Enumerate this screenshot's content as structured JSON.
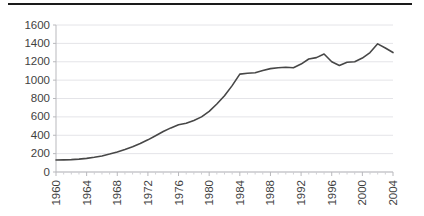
{
  "figure": {
    "top_rule_color": "#1a1a1a",
    "background_color": "#ffffff"
  },
  "chart_data": {
    "type": "line",
    "title": "",
    "subtitle": "",
    "xlabel": "",
    "ylabel": "",
    "xlim": [
      1960,
      2004
    ],
    "ylim": [
      0,
      1600
    ],
    "yticks": [
      0,
      200,
      400,
      600,
      800,
      1000,
      1200,
      1400,
      1600
    ],
    "ytick_labels": [
      "0",
      "200",
      "400",
      "600",
      "800",
      "1000",
      "1200",
      "1400",
      "1600"
    ],
    "xticks": [
      1960,
      1964,
      1968,
      1972,
      1976,
      1980,
      1984,
      1988,
      1992,
      1996,
      2000,
      2004
    ],
    "xtick_labels": [
      "1960",
      "1964",
      "1968",
      "1972",
      "1976",
      "1980",
      "1984",
      "1988",
      "1992",
      "1996",
      "2000",
      "2004"
    ],
    "xtick_rotation": 90,
    "grid": "horizontal",
    "legend": "none",
    "annotations": [],
    "line_color": "#474747",
    "series": [
      {
        "name": "series-1",
        "x": [
          1960,
          1961,
          1962,
          1963,
          1964,
          1965,
          1966,
          1967,
          1968,
          1969,
          1970,
          1971,
          1972,
          1973,
          1974,
          1975,
          1976,
          1977,
          1978,
          1979,
          1980,
          1981,
          1982,
          1983,
          1984,
          1985,
          1986,
          1987,
          1988,
          1989,
          1990,
          1991,
          1992,
          1993,
          1994,
          1995,
          1996,
          1997,
          1998,
          1999,
          2000,
          2001,
          2002,
          2003,
          2004
        ],
        "values": [
          130,
          132,
          135,
          140,
          148,
          160,
          175,
          195,
          218,
          245,
          275,
          310,
          350,
          395,
          440,
          480,
          515,
          530,
          560,
          600,
          660,
          740,
          830,
          940,
          1065,
          1075,
          1080,
          1105,
          1125,
          1135,
          1140,
          1135,
          1175,
          1230,
          1245,
          1285,
          1200,
          1160,
          1195,
          1200,
          1240,
          1300,
          1395,
          1350,
          1300
        ]
      }
    ]
  }
}
